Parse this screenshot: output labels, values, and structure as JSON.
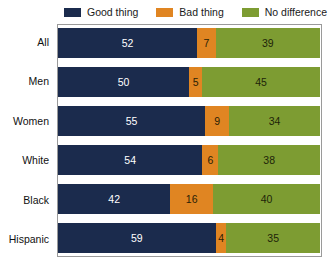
{
  "chart_data": {
    "type": "bar",
    "orientation": "horizontal",
    "stacked": true,
    "stack_mode": "percent",
    "title": "",
    "subtitle": "",
    "xlabel": "",
    "ylabel": "",
    "xlim": [
      0,
      100
    ],
    "grid": false,
    "legend_position": "top-right",
    "categories": [
      "All",
      "Men",
      "Women",
      "White",
      "Black",
      "Hispanic"
    ],
    "series": [
      {
        "name": "Good thing",
        "color": "#1b2b4d",
        "label_color": "#ffffff",
        "values": [
          52,
          50,
          55,
          54,
          42,
          59
        ]
      },
      {
        "name": "Bad thing",
        "color": "#e08522",
        "label_color": "#2a2206",
        "values": [
          7,
          5,
          9,
          6,
          16,
          4
        ]
      },
      {
        "name": "No difference",
        "color": "#7d9c32",
        "label_color": "#1d2409",
        "values": [
          39,
          45,
          34,
          38,
          40,
          35
        ]
      }
    ],
    "rows": [
      {
        "category": "All",
        "segments": [
          {
            "series": "Good thing",
            "value": 52,
            "label": "52"
          },
          {
            "series": "Bad thing",
            "value": 7,
            "label": "7"
          },
          {
            "series": "No difference",
            "value": 39,
            "label": "39"
          }
        ]
      },
      {
        "category": "Men",
        "segments": [
          {
            "series": "Good thing",
            "value": 50,
            "label": "50"
          },
          {
            "series": "Bad thing",
            "value": 5,
            "label": "5"
          },
          {
            "series": "No difference",
            "value": 45,
            "label": "45"
          }
        ]
      },
      {
        "category": "Women",
        "segments": [
          {
            "series": "Good thing",
            "value": 55,
            "label": "55"
          },
          {
            "series": "Bad thing",
            "value": 9,
            "label": "9"
          },
          {
            "series": "No difference",
            "value": 34,
            "label": "34"
          }
        ]
      },
      {
        "category": "White",
        "segments": [
          {
            "series": "Good thing",
            "value": 54,
            "label": "54"
          },
          {
            "series": "Bad thing",
            "value": 6,
            "label": "6"
          },
          {
            "series": "No difference",
            "value": 38,
            "label": "38"
          }
        ]
      },
      {
        "category": "Black",
        "segments": [
          {
            "series": "Good thing",
            "value": 42,
            "label": "42"
          },
          {
            "series": "Bad thing",
            "value": 16,
            "label": "16"
          },
          {
            "series": "No difference",
            "value": 40,
            "label": "40"
          }
        ]
      },
      {
        "category": "Hispanic",
        "segments": [
          {
            "series": "Good thing",
            "value": 59,
            "label": "59"
          },
          {
            "series": "Bad thing",
            "value": 4,
            "label": "4"
          },
          {
            "series": "No difference",
            "value": 35,
            "label": "35"
          }
        ]
      }
    ]
  },
  "legend": {
    "items": [
      {
        "label": "Good thing",
        "color": "#1b2b4d"
      },
      {
        "label": "Bad thing",
        "color": "#e08522"
      },
      {
        "label": "No difference",
        "color": "#7d9c32"
      }
    ]
  },
  "colors": {
    "good_thing": "#1b2b4d",
    "bad_thing": "#e08522",
    "no_difference": "#7d9c32",
    "plot_border": "#9a9a9a",
    "background": "#ffffff",
    "axis_text": "#111111"
  }
}
